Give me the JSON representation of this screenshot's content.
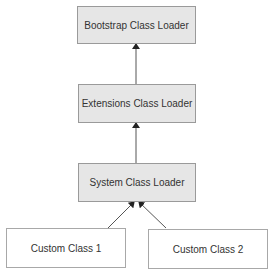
{
  "diagram": {
    "nodes": [
      {
        "id": "bootstrap",
        "label": "Bootstrap Class Loader"
      },
      {
        "id": "extensions",
        "label": "Extensions Class Loader"
      },
      {
        "id": "system",
        "label": "System Class Loader"
      },
      {
        "id": "custom1",
        "label": "Custom Class 1"
      },
      {
        "id": "custom2",
        "label": "Custom Class 2"
      }
    ],
    "edges": [
      {
        "from": "extensions",
        "to": "bootstrap"
      },
      {
        "from": "system",
        "to": "extensions"
      },
      {
        "from": "custom1",
        "to": "system"
      },
      {
        "from": "custom2",
        "to": "system"
      }
    ],
    "colors": {
      "loader_fill": "#e6e6e6",
      "custom_fill": "#ffffff",
      "border": "#9a9a9a",
      "arrow": "#333333"
    }
  }
}
